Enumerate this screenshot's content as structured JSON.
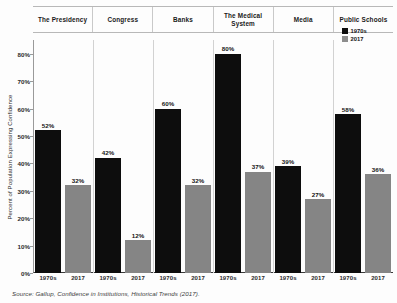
{
  "chart_data": {
    "type": "bar",
    "title": "",
    "xlabel": "",
    "ylabel": "Percent of Population Expressing Confidence",
    "ylim": [
      0,
      85
    ],
    "ytick_values": [
      0,
      10,
      20,
      30,
      40,
      50,
      60,
      70,
      80
    ],
    "ytick_labels": [
      "0%",
      "10%",
      "20%",
      "30%",
      "40%",
      "50%",
      "60%",
      "70%",
      "80%"
    ],
    "grid": false,
    "legend_position": "top-right",
    "categories": [
      "The Presidency",
      "Congress",
      "Banks",
      "The Medical System",
      "Media",
      "Public Schools"
    ],
    "series": [
      {
        "name": "1970s",
        "color": "#0d0d0d",
        "values": [
          52,
          42,
          60,
          80,
          39,
          58
        ],
        "labels": [
          "52%",
          "42%",
          "60%",
          "80%",
          "39%",
          "58%"
        ]
      },
      {
        "name": "2017",
        "color": "#858585",
        "values": [
          32,
          12,
          32,
          37,
          27,
          36
        ],
        "labels": [
          "32%",
          "12%",
          "32%",
          "37%",
          "27%",
          "36%"
        ]
      }
    ],
    "x_tick_labels": [
      [
        "1970s",
        "2017"
      ],
      [
        "1970s",
        "2017"
      ],
      [
        "1970s",
        "2017"
      ],
      [
        "1970s",
        "2017"
      ],
      [
        "1970s",
        "2017"
      ],
      [
        "1970s",
        "2017"
      ]
    ],
    "source_note": "Source: Gallup, Confidence in Institutions, Historical Trends (2017)."
  },
  "legend": {
    "items": [
      {
        "label": "1970s",
        "color": "#0d0d0d"
      },
      {
        "label": "2017",
        "color": "#858585"
      }
    ]
  }
}
